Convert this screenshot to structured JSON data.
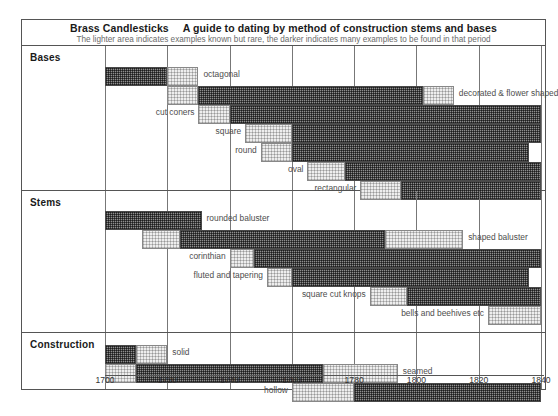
{
  "header": {
    "title_main": "Brass Candlesticks",
    "title_sub": "A guide to dating by method of construction stems and bases",
    "subtitle": "The lighter area indicates examples known but rare, the darker indicates many examples to be found in that period"
  },
  "axis": {
    "min": 1700,
    "max": 1840,
    "ticks": [
      "1700",
      "1720",
      "1740",
      "1760",
      "1780",
      "1800",
      "1820",
      "1840"
    ]
  },
  "groups": [
    {
      "label": "Bases"
    },
    {
      "label": "Stems"
    },
    {
      "label": "Construction"
    }
  ],
  "chart_data": {
    "type": "bar",
    "subtitle": "The lighter area indicates examples known but rare, the darker indicates many examples to be found in that period",
    "xlabel": "",
    "ylabel": "",
    "xlim": [
      1700,
      1840
    ],
    "grid": true,
    "legend": [
      {
        "name": "many examples",
        "style": "dark"
      },
      {
        "name": "known but rare",
        "style": "light"
      }
    ],
    "groups": [
      {
        "name": "Bases",
        "rows": [
          {
            "label": "octagonal",
            "label_side": "right",
            "segments": [
              {
                "style": "dark",
                "start": 1700,
                "end": 1720
              },
              {
                "style": "light",
                "start": 1720,
                "end": 1730
              }
            ]
          },
          {
            "label": "decorated & flower shaped",
            "label_side": "right",
            "segments": [
              {
                "style": "light",
                "start": 1720,
                "end": 1730
              },
              {
                "style": "dark",
                "start": 1730,
                "end": 1802
              },
              {
                "style": "light",
                "start": 1802,
                "end": 1812
              }
            ]
          },
          {
            "label": "cut coners",
            "label_side": "left",
            "segments": [
              {
                "style": "light",
                "start": 1730,
                "end": 1740
              },
              {
                "style": "dark",
                "start": 1740,
                "end": 1840
              }
            ]
          },
          {
            "label": "square",
            "label_side": "left",
            "segments": [
              {
                "style": "light",
                "start": 1745,
                "end": 1760
              },
              {
                "style": "dark",
                "start": 1760,
                "end": 1840
              }
            ]
          },
          {
            "label": "round",
            "label_side": "left",
            "segments": [
              {
                "style": "light",
                "start": 1750,
                "end": 1760
              },
              {
                "style": "dark",
                "start": 1760,
                "end": 1836
              }
            ]
          },
          {
            "label": "oval",
            "label_side": "left",
            "segments": [
              {
                "style": "light",
                "start": 1765,
                "end": 1777
              },
              {
                "style": "dark",
                "start": 1777,
                "end": 1840
              }
            ]
          },
          {
            "label": "rectangular",
            "label_side": "left",
            "segments": [
              {
                "style": "light",
                "start": 1782,
                "end": 1795
              },
              {
                "style": "dark",
                "start": 1795,
                "end": 1840
              }
            ]
          }
        ]
      },
      {
        "name": "Stems",
        "rows": [
          {
            "label": "rounded baluster",
            "label_side": "right",
            "segments": [
              {
                "style": "dark",
                "start": 1700,
                "end": 1731
              }
            ]
          },
          {
            "label": "shaped baluster",
            "label_side": "right",
            "segments": [
              {
                "style": "light",
                "start": 1712,
                "end": 1724
              },
              {
                "style": "dark",
                "start": 1724,
                "end": 1790
              },
              {
                "style": "light",
                "start": 1790,
                "end": 1815
              }
            ]
          },
          {
            "label": "corinthian",
            "label_side": "left",
            "segments": [
              {
                "style": "light",
                "start": 1740,
                "end": 1748
              },
              {
                "style": "dark",
                "start": 1748,
                "end": 1840
              }
            ]
          },
          {
            "label": "fluted and tapering",
            "label_side": "left",
            "segments": [
              {
                "style": "light",
                "start": 1752,
                "end": 1760
              },
              {
                "style": "dark",
                "start": 1760,
                "end": 1836
              }
            ]
          },
          {
            "label": "square cut knops",
            "label_side": "left",
            "segments": [
              {
                "style": "light",
                "start": 1785,
                "end": 1797
              },
              {
                "style": "dark",
                "start": 1797,
                "end": 1840
              }
            ]
          },
          {
            "label": "bells and beehives etc",
            "label_side": "left",
            "segments": [
              {
                "style": "light",
                "start": 1823,
                "end": 1840
              }
            ]
          }
        ]
      },
      {
        "name": "Construction",
        "rows": [
          {
            "label": "solid",
            "label_side": "right",
            "segments": [
              {
                "style": "dark",
                "start": 1700,
                "end": 1710
              },
              {
                "style": "light",
                "start": 1710,
                "end": 1720
              }
            ]
          },
          {
            "label": "seamed",
            "label_side": "right",
            "segments": [
              {
                "style": "light",
                "start": 1700,
                "end": 1710
              },
              {
                "style": "dark",
                "start": 1710,
                "end": 1770
              },
              {
                "style": "light",
                "start": 1770,
                "end": 1794
              }
            ]
          },
          {
            "label": "hollow",
            "label_side": "left",
            "segments": [
              {
                "style": "light",
                "start": 1760,
                "end": 1780
              },
              {
                "style": "dark",
                "start": 1780,
                "end": 1840
              }
            ]
          }
        ]
      }
    ]
  }
}
